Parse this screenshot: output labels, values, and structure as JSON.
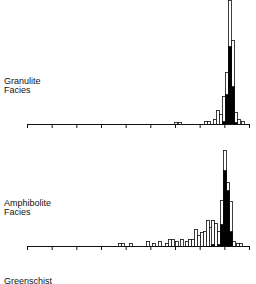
{
  "chart_data": [
    {
      "type": "bar",
      "title": "Granulite Facies",
      "label_lines": [
        "Granulite",
        "Facies"
      ],
      "xlabel": "",
      "ylabel": "",
      "axis": {
        "ticks": 10,
        "grid": false
      },
      "bin_width_px": 3,
      "open_series": {
        "name": "total",
        "bins": [
          {
            "x": 174,
            "h": 2
          },
          {
            "x": 178,
            "h": 2
          },
          {
            "x": 204,
            "h": 3
          },
          {
            "x": 207,
            "h": 3
          },
          {
            "x": 213,
            "h": 5
          },
          {
            "x": 216,
            "h": 14
          },
          {
            "x": 219,
            "h": 10
          },
          {
            "x": 222,
            "h": 28
          },
          {
            "x": 225,
            "h": 52
          },
          {
            "x": 228,
            "h": 124
          },
          {
            "x": 231,
            "h": 84
          },
          {
            "x": 234,
            "h": 12
          },
          {
            "x": 237,
            "h": 5
          },
          {
            "x": 241,
            "h": 3
          }
        ]
      },
      "filled_series": {
        "name": "subset",
        "bins": [
          {
            "x": 222,
            "h": 3
          },
          {
            "x": 225,
            "h": 30
          },
          {
            "x": 228,
            "h": 78
          },
          {
            "x": 231,
            "h": 38
          },
          {
            "x": 234,
            "h": 2
          }
        ]
      }
    },
    {
      "type": "bar",
      "title": "Amphibolite Facies",
      "label_lines": [
        "Amphibolite",
        "Facies"
      ],
      "xlabel": "",
      "ylabel": "",
      "axis": {
        "ticks": 10,
        "grid": false
      },
      "bin_width_px": 3,
      "open_series": {
        "name": "total",
        "bins": [
          {
            "x": 118,
            "h": 3
          },
          {
            "x": 121,
            "h": 3
          },
          {
            "x": 129,
            "h": 3
          },
          {
            "x": 146,
            "h": 5
          },
          {
            "x": 152,
            "h": 3
          },
          {
            "x": 158,
            "h": 5
          },
          {
            "x": 165,
            "h": 3
          },
          {
            "x": 168,
            "h": 7
          },
          {
            "x": 171,
            "h": 7
          },
          {
            "x": 175,
            "h": 5
          },
          {
            "x": 180,
            "h": 7
          },
          {
            "x": 185,
            "h": 5
          },
          {
            "x": 188,
            "h": 7
          },
          {
            "x": 191,
            "h": 7
          },
          {
            "x": 194,
            "h": 17
          },
          {
            "x": 197,
            "h": 11
          },
          {
            "x": 200,
            "h": 14
          },
          {
            "x": 203,
            "h": 15
          },
          {
            "x": 206,
            "h": 26
          },
          {
            "x": 209,
            "h": 19
          },
          {
            "x": 211,
            "h": 26
          },
          {
            "x": 214,
            "h": 23
          },
          {
            "x": 217,
            "h": 15
          },
          {
            "x": 220,
            "h": 46
          },
          {
            "x": 223,
            "h": 96
          },
          {
            "x": 226,
            "h": 64
          },
          {
            "x": 229,
            "h": 45
          },
          {
            "x": 232,
            "h": 5
          },
          {
            "x": 236,
            "h": 3
          },
          {
            "x": 239,
            "h": 3
          }
        ]
      },
      "filled_series": {
        "name": "subset",
        "bins": [
          {
            "x": 211,
            "h": 2
          },
          {
            "x": 217,
            "h": 2
          },
          {
            "x": 220,
            "h": 22
          },
          {
            "x": 223,
            "h": 76
          },
          {
            "x": 226,
            "h": 56
          },
          {
            "x": 229,
            "h": 15
          }
        ]
      }
    },
    {
      "type": "bar",
      "title": "Greenschist",
      "label_lines": [
        "Greenschist"
      ],
      "partial": true
    }
  ]
}
